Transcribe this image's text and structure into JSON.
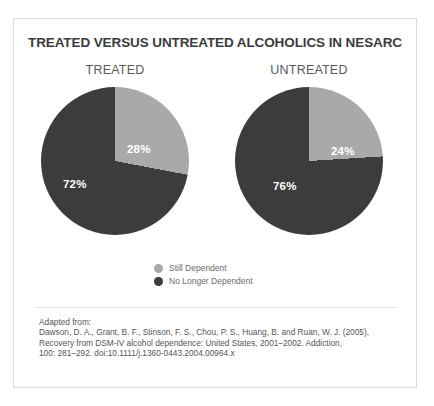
{
  "chart_data": {
    "type": "pie",
    "title": "TREATED VERSUS UNTREATED ALCOHOLICS IN NESARC",
    "legend_position": "bottom-center",
    "colors": {
      "still_dependent": "#a9a9a9",
      "no_longer_dependent": "#3c3c3c",
      "label_text": "#ffffff",
      "title_text": "#3b3b3b",
      "frame_border": "#dcdcdc"
    },
    "legend": [
      {
        "label": "Still Dependent",
        "color": "#a9a9a9"
      },
      {
        "label": "No Longer Dependent",
        "color": "#3c3c3c"
      }
    ],
    "categories": [
      "Still Dependent",
      "No Longer Dependent"
    ],
    "panels": [
      {
        "name": "TREATED",
        "values": [
          28,
          72
        ],
        "slices": [
          {
            "label": "28%",
            "value": 28,
            "category": "Still Dependent",
            "color": "#a9a9a9"
          },
          {
            "label": "72%",
            "value": 72,
            "category": "No Longer Dependent",
            "color": "#3c3c3c"
          }
        ]
      },
      {
        "name": "UNTREATED",
        "values": [
          24,
          76
        ],
        "slices": [
          {
            "label": "24%",
            "value": 24,
            "category": "Still Dependent",
            "color": "#a9a9a9"
          },
          {
            "label": "76%",
            "value": 76,
            "category": "No Longer Dependent",
            "color": "#3c3c3c"
          }
        ]
      }
    ]
  },
  "citation": {
    "lines": [
      "Adapted from:",
      "Dawson, D. A., Grant, B. F., Stinson, F. S., Chou, P. S., Huang, B. and Ruan, W. J. (2005),",
      "Recovery from DSM-IV alcohol dependence: United States, 2001–2002. Addiction,",
      "100: 281–292. doi:10.1111/j.1360-0443.2004.00964.x"
    ]
  }
}
